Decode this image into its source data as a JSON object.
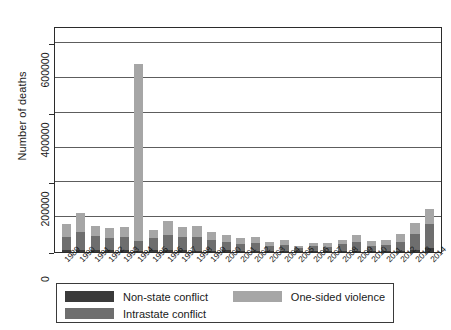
{
  "chart_data": {
    "type": "bar",
    "stacked": true,
    "title": "",
    "xlabel": "",
    "ylabel": "Number of deaths",
    "ylim": [
      0,
      650000
    ],
    "yticks": [
      0,
      200000,
      400000,
      600000
    ],
    "ytick_labels": [
      "0",
      "200000",
      "400000",
      "600000"
    ],
    "gridlines": [
      100000,
      200000,
      300000,
      400000,
      500000,
      600000
    ],
    "grid": true,
    "legend_position": "bottom",
    "categories": [
      "1989",
      "1990",
      "1991",
      "1992",
      "1993",
      "1994",
      "1995",
      "1996",
      "1997",
      "1998",
      "1999",
      "2000",
      "2001",
      "2002",
      "2003",
      "2004",
      "2005",
      "2006",
      "2007",
      "2008",
      "2009",
      "2010",
      "2011",
      "2012",
      "2013",
      "2014"
    ],
    "series": [
      {
        "name": "Non-state conflict",
        "color": "#3a3a3a",
        "values": [
          6000,
          7000,
          5000,
          7000,
          6000,
          4000,
          6000,
          6000,
          5000,
          4000,
          4000,
          5000,
          4000,
          4000,
          3000,
          3000,
          2000,
          3000,
          3000,
          4000,
          4000,
          3000,
          3000,
          4000,
          5000,
          12000
        ]
      },
      {
        "name": "Intrastate conflict",
        "color": "#6e6e6e",
        "values": [
          38000,
          52000,
          41000,
          34000,
          38000,
          28000,
          33000,
          42000,
          38000,
          38000,
          30000,
          25000,
          19000,
          21000,
          14000,
          17000,
          9000,
          13000,
          12000,
          19000,
          25000,
          15000,
          18000,
          26000,
          48000,
          68000
        ]
      },
      {
        "name": "One-sided violence",
        "color": "#a6a6a6",
        "values": [
          37000,
          52000,
          28000,
          27000,
          29000,
          508000,
          24000,
          40000,
          30000,
          32000,
          23000,
          20000,
          16000,
          17000,
          12000,
          14000,
          7000,
          11000,
          10000,
          13000,
          20000,
          13000,
          15000,
          22000,
          30000,
          45000
        ]
      }
    ],
    "annotations": [
      "Tallest bar occurs in 1994 and reaches approximately 540000 total deaths, dominated by one-sided violence."
    ]
  },
  "legend": {
    "entries": [
      {
        "label": "Non-state conflict",
        "color": "#3a3a3a"
      },
      {
        "label": "One-sided violence",
        "color": "#a6a6a6"
      },
      {
        "label": "Intrastate conflict",
        "color": "#6e6e6e"
      }
    ]
  },
  "footer": {
    "cutoff_text_fragment": ""
  }
}
